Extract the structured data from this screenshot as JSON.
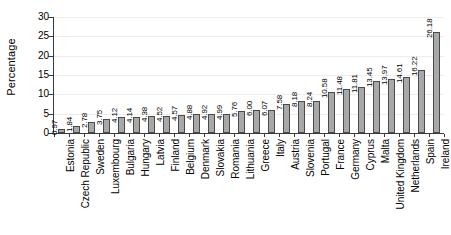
{
  "chart_data": {
    "type": "bar",
    "title": "",
    "xlabel": "",
    "ylabel": "Percentage",
    "ylim": [
      0,
      30
    ],
    "yticks": [
      0,
      5,
      10,
      15,
      20,
      25,
      30
    ],
    "grid": true,
    "legend": false,
    "orientation": "vertical",
    "bar_color": "#a8a8a8",
    "bar_edge_color": "#4a4a4a",
    "value_labels_shown": true,
    "categories": [
      "Estonia",
      "Czech Republic",
      "Sweden",
      "Luxembourg",
      "Bulgaria",
      "Hungary",
      "Latvia",
      "Finland",
      "Belgium",
      "Denmark",
      "Slovakia",
      "Romania",
      "Lithuania",
      "Greece",
      "Italy",
      "Austria",
      "Slovenia",
      "Portugal",
      "France",
      "Germany",
      "Cyprus",
      "Malta",
      "United Kingdom",
      "Netherlands",
      "Spain",
      "Ireland"
    ],
    "values": [
      0.97,
      1.84,
      2.78,
      3.75,
      4.12,
      4.14,
      4.38,
      4.52,
      4.57,
      4.88,
      4.92,
      4.99,
      5.76,
      6.0,
      6.07,
      7.58,
      8.18,
      8.24,
      10.58,
      11.48,
      11.81,
      13.45,
      13.97,
      14.61,
      16.22,
      26.18
    ],
    "value_labels": [
      "0.97",
      "1.84",
      "2.78",
      "3.75",
      "4.12",
      "4.14",
      "4.38",
      "4.52",
      "4.57",
      "4.88",
      "4.92",
      "4.99",
      "5.76",
      "6.00",
      "6.07",
      "7.58",
      "8.18",
      "8.24",
      "10.58",
      "11.48",
      "11.81",
      "13.45",
      "13.97",
      "14.61",
      "16.22",
      "26.18"
    ],
    "ytick_labels": [
      "0",
      "5",
      "10",
      "15",
      "20",
      "25",
      "30"
    ]
  }
}
